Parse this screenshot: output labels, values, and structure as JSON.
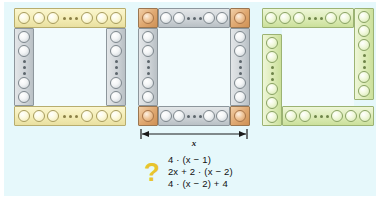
{
  "canvas": {
    "background_color": "#e6f8fb",
    "page_background": "#ffffff"
  },
  "figures": [
    {
      "id": "figure-a",
      "name": "square-frame-yellow-gray",
      "description": "Square frame of pegs: yellow horizontal strips top and bottom spanning full width, gray vertical strips left and right between them",
      "colors": {
        "horizontal": "#f3ecb4",
        "vertical": "#cfd4d8"
      },
      "top_strip": {
        "pegs_before": 3,
        "ellipsis": "...",
        "pegs_after": 3
      },
      "bottom_strip": {
        "pegs_before": 3,
        "ellipsis": "...",
        "pegs_after": 3
      },
      "left_strip": {
        "pegs_before": 2,
        "ellipsis": "...",
        "pegs_after": 2
      },
      "right_strip": {
        "pegs_before": 2,
        "ellipsis": "...",
        "pegs_after": 2
      }
    },
    {
      "id": "figure-b",
      "name": "square-frame-gray-orange-corners",
      "description": "Square frame of pegs with four highlighted orange corner tiles; gray strips between the corners",
      "colors": {
        "strips": "#cfd4d8",
        "corners": "#e0a972"
      },
      "corners": 4,
      "top_strip": {
        "pegs_before": 2,
        "ellipsis": "...",
        "pegs_after": 2
      },
      "bottom_strip": {
        "pegs_before": 2,
        "ellipsis": "...",
        "pegs_after": 2
      },
      "left_strip": {
        "pegs_before": 2,
        "ellipsis": "...",
        "pegs_after": 2
      },
      "right_strip": {
        "pegs_before": 2,
        "ellipsis": "...",
        "pegs_after": 2
      }
    },
    {
      "id": "figure-c",
      "name": "square-frame-green-pinwheel",
      "description": "Square frame of green peg strips arranged in a pinwheel: each strip covers one corner",
      "colors": {
        "strips": "#dcebb6"
      },
      "top_strip": {
        "pegs_before": 3,
        "ellipsis": "...",
        "pegs_after": 2
      },
      "bottom_strip": {
        "pegs_before": 2,
        "ellipsis": "...",
        "pegs_after": 3
      },
      "left_strip": {
        "pegs_before": 2,
        "ellipsis": "...",
        "pegs_after": 3
      },
      "right_strip": {
        "pegs_before": 3,
        "ellipsis": "...",
        "pegs_after": 2
      }
    }
  ],
  "dimension": {
    "label": "x",
    "description": "double-headed arrow measuring the full side length of the middle figure"
  },
  "question": {
    "marker": "?",
    "marker_color": "#e8c42e",
    "expressions": [
      "4 · (x − 1)",
      "2x + 2 · (x − 2)",
      "4 · (x − 2) + 4"
    ]
  }
}
